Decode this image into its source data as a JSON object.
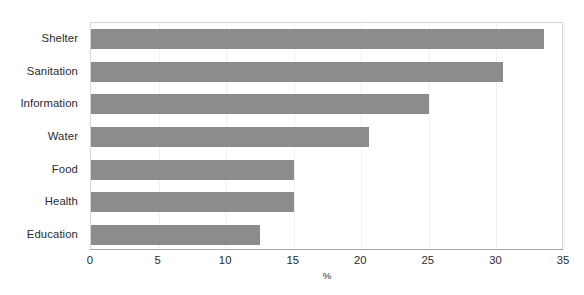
{
  "figure": {
    "caption_remnant": "",
    "background_color": "#ffffff",
    "bar_color": "#8c8c8c",
    "frame_color": "#d6d6d6",
    "grid_color": "#f0f0f0",
    "axis_color": "#a8a8a8",
    "text_color": "#2b2b2b"
  },
  "chart_data": {
    "type": "bar",
    "orientation": "horizontal",
    "title": "",
    "subtitle": "",
    "xlabel": "%",
    "ylabel": "",
    "categories": [
      "Shelter",
      "Sanitation",
      "Information",
      "Water",
      "Food",
      "Health",
      "Education"
    ],
    "values": [
      33.5,
      30.5,
      25.0,
      20.6,
      15.0,
      15.0,
      12.5
    ],
    "xlim": [
      0,
      35
    ],
    "xticks": [
      0,
      5,
      10,
      15,
      20,
      25,
      30,
      35
    ],
    "xtick_labels": [
      "0",
      "5",
      "10",
      "15",
      "20",
      "25",
      "30",
      "35"
    ],
    "grid": true,
    "grid_axis": "x",
    "legend": false,
    "legend_position": "none",
    "annotations": [],
    "series": [
      {
        "name": "",
        "color": "#8c8c8c",
        "values": [
          33.5,
          30.5,
          25.0,
          20.6,
          15.0,
          15.0,
          12.5
        ]
      }
    ]
  }
}
